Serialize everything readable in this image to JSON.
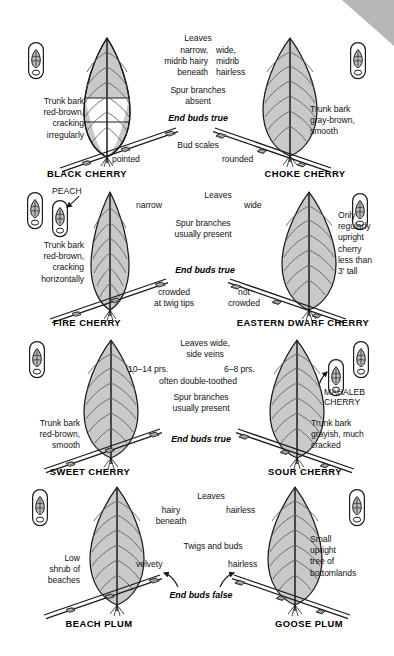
{
  "page": {
    "background_color": "#ffffff",
    "leaf_fill_color": "#c9c9c9",
    "leaf_underside_color": "#ffffff",
    "ink_color": "#131313",
    "corner_fold_color": "#b4b4b4"
  },
  "rows": [
    {
      "id": "row-cherry-1",
      "center": {
        "heading": "Leaves",
        "left_trait": "narrow,\nmidrib hairy\nbeneath",
        "right_trait": "wide,\nmidrib\nhairless",
        "shared_trait": "Spur branches\nabsent",
        "end_buds": "End buds true",
        "bud_scales_label": "Bud scales",
        "left_bud_scales": "pointed",
        "right_bud_scales": "rounded"
      },
      "left": {
        "species": "BLACK CHERRY",
        "note": "Trunk bark\nred-brown,\ncracking\nirregularly",
        "leaf_shape": "narrow-ovate-cutaway",
        "bud_icon": "twig-bud-icon"
      },
      "right": {
        "species": "CHOKE CHERRY",
        "note": "Trunk bark\ngray-brown,\nsmooth",
        "leaf_shape": "wide-ovate",
        "bud_icon": "twig-bud-icon"
      }
    },
    {
      "id": "row-cherry-2",
      "center": {
        "heading": "Leaves",
        "left_trait": "narrow",
        "right_trait": "wide",
        "shared_trait": "Spur branches\nusually present",
        "end_buds": "End buds true",
        "left_bud_arrangement": "crowded\nat twig tips",
        "right_bud_arrangement": "not\ncrowded"
      },
      "left": {
        "species": "FIRE CHERRY",
        "note": "Trunk bark\nred-brown,\ncracking\nhorizontally",
        "minor_species": "PEACH",
        "leaf_shape": "narrow-lanceolate",
        "bud_icon": "twig-bud-icon"
      },
      "right": {
        "species": "EASTERN DWARF CHERRY",
        "note": "Only\nregularly\nupright\ncherry\nless than\n3' tall",
        "leaf_shape": "wide-ovate",
        "bud_icon": "twig-bud-icon"
      }
    },
    {
      "id": "row-cherry-3",
      "center": {
        "heading": "Leaves wide,\nside veins",
        "left_trait": "10–14 prs.",
        "right_trait": "6–8 prs.",
        "sub_trait": "often double-toothed",
        "shared_trait": "Spur branches\nusually present",
        "end_buds": "End buds true"
      },
      "left": {
        "species": "SWEET CHERRY",
        "note": "Trunk bark\nred-brown,\nsmooth",
        "leaf_shape": "wide-ovate",
        "bud_icon": "twig-bud-icon"
      },
      "right": {
        "species": "SOUR CHERRY",
        "note": "Trunk bark\ngrayish, much\ncracked",
        "minor_species": "MAHALEB\nCHERRY",
        "leaf_shape": "wide-ovate",
        "bud_icon": "twig-bud-icon"
      }
    },
    {
      "id": "row-plum",
      "center": {
        "heading": "Leaves",
        "left_trait": "hairy\nbeneath",
        "right_trait": "hairless",
        "twig_heading": "Twigs and buds",
        "left_twig_trait": "velvety",
        "right_twig_trait": "hairless",
        "end_buds": "End buds false"
      },
      "left": {
        "species": "BEACH PLUM",
        "note": "Low\nshrub of\nbeaches",
        "leaf_shape": "wide-ovate",
        "bud_icon": "twig-bud-icon"
      },
      "right": {
        "species": "GOOSE PLUM",
        "note": "Small\nupright\ntree of\nbottomlands",
        "leaf_shape": "wide-ovate",
        "bud_icon": "twig-bud-icon"
      }
    }
  ]
}
